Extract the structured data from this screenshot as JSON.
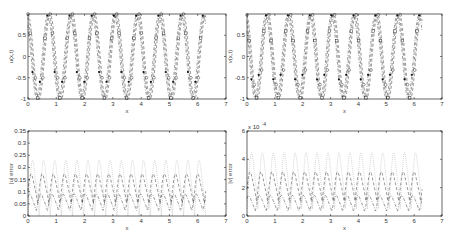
{
  "chart_data": [
    {
      "id": "top-left",
      "type": "line",
      "title": "",
      "xlabel": "x",
      "ylabel": "u(x,t)",
      "xlim": [
        0,
        7
      ],
      "ylim": [
        -1,
        1
      ],
      "xticks": [
        "0",
        "1",
        "2",
        "3",
        "4",
        "5",
        "6",
        "7"
      ],
      "yticks": [
        "-1",
        "-0.5",
        "0",
        "0.5"
      ],
      "grid": false,
      "legend": null,
      "x_range": [
        0,
        6.2832
      ],
      "cycles": 8,
      "series": [
        {
          "name": "exact (dashed, circles)",
          "style": "dashed",
          "marker": "circle",
          "amplitude": 1.0,
          "phase": 0.0
        },
        {
          "name": "numeric (dashed, squares)",
          "style": "dashed",
          "marker": "square",
          "amplitude": 0.98,
          "phase": 0.35
        },
        {
          "name": "numeric (dash-dot, filled dots)",
          "style": "dashdot",
          "marker": "dot",
          "amplitude": 0.97,
          "phase": 0.7
        }
      ]
    },
    {
      "id": "top-right",
      "type": "line",
      "title": "",
      "xlabel": "x",
      "ylabel": "v(x,t)",
      "xlim": [
        0,
        7
      ],
      "ylim": [
        -1,
        1
      ],
      "xticks": [
        "0",
        "1",
        "2",
        "3",
        "4",
        "5",
        "6",
        "7"
      ],
      "yticks": [
        "-1",
        "-0.5",
        "0",
        "0.5"
      ],
      "grid": false,
      "legend": null,
      "x_range": [
        0,
        6.2832
      ],
      "cycles": 8,
      "series": [
        {
          "name": "exact (dashed, circles)",
          "style": "dashed",
          "marker": "circle",
          "amplitude": 1.0,
          "phase": 0.2
        },
        {
          "name": "numeric (dashed, squares)",
          "style": "dashed",
          "marker": "square",
          "amplitude": 0.98,
          "phase": 0.55
        },
        {
          "name": "numeric (dash-dot, filled dots)",
          "style": "dashdot",
          "marker": "dot",
          "amplitude": 0.97,
          "phase": 0.9
        }
      ]
    },
    {
      "id": "bottom-left",
      "type": "line",
      "title": "",
      "xlabel": "x",
      "ylabel": "|u| error",
      "xlim": [
        0,
        7
      ],
      "ylim": [
        0,
        0.35
      ],
      "xticks": [
        "0",
        "1",
        "2",
        "3",
        "4",
        "5",
        "6",
        "7"
      ],
      "yticks": [
        "0",
        "0.05",
        "0.1",
        "0.15",
        "0.2",
        "0.25",
        "0.3",
        "0.35"
      ],
      "grid": false,
      "legend": null,
      "x_range": [
        0,
        6.2832
      ],
      "cycles": 8,
      "series": [
        {
          "name": "error 1 (dotted, light)",
          "style": "dotted",
          "base": 0.0,
          "peak": 0.26,
          "phase": 0.0
        },
        {
          "name": "error 2 (dashed)",
          "style": "dashed",
          "base": 0.05,
          "peak": 0.19,
          "phase": 0.4
        },
        {
          "name": "error 3 (dash-dot)",
          "style": "dashdot",
          "base": 0.02,
          "peak": 0.1,
          "phase": 0.8
        }
      ]
    },
    {
      "id": "bottom-right",
      "type": "line",
      "title": "",
      "xlabel": "x",
      "ylabel": "|v| error",
      "exponent_label": "x 10^-4",
      "xlim": [
        0,
        7
      ],
      "ylim": [
        0,
        6
      ],
      "y_scale": 0.0001,
      "xticks": [
        "0",
        "1",
        "2",
        "3",
        "4",
        "5",
        "6",
        "7"
      ],
      "yticks": [
        "0",
        "2",
        "4",
        "6"
      ],
      "grid": false,
      "legend": null,
      "x_range": [
        0,
        6.2832
      ],
      "cycles": 8,
      "series": [
        {
          "name": "error 1 (dotted, light)",
          "style": "dotted",
          "base": 0.5,
          "peak": 5.0,
          "phase": 0.0
        },
        {
          "name": "error 2 (dashed)",
          "style": "dashed",
          "base": 1.0,
          "peak": 3.4,
          "phase": 0.4
        },
        {
          "name": "error 3 (dash-dot)",
          "style": "dashdot",
          "base": 0.3,
          "peak": 1.6,
          "phase": 0.8
        }
      ]
    }
  ],
  "panels": {
    "tl": {
      "ylabel": "u(x,t)",
      "xlabel": "x"
    },
    "tr": {
      "ylabel": "v(x,t)",
      "xlabel": "x"
    },
    "bl": {
      "ylabel": "|u| error",
      "xlabel": "x"
    },
    "br": {
      "ylabel": "|v| error",
      "xlabel": "x",
      "exponent": "x 10"
    }
  },
  "colors": {
    "axis": "#000000",
    "curve_dark": "#333333",
    "curve_light": "#aaaaaa",
    "background": "#ffffff"
  }
}
